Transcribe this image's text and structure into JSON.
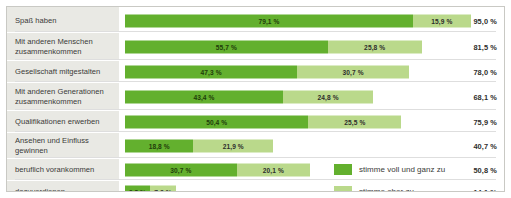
{
  "chart_data": {
    "type": "bar",
    "orientation": "horizontal",
    "stacked": true,
    "title": "",
    "subtitle": "",
    "xlabel": "",
    "ylabel": "",
    "xlim": [
      0,
      100
    ],
    "grid": false,
    "legend_position": "inside-bottom-right",
    "value_suffix": "%",
    "categories": [
      "Spaß haben",
      "Mit anderen Menschen zusammenkommen",
      "Gesellschaft mitgestalten",
      "Mit anderen Generationen zusammenkommen",
      "Qualifikationen erwerben",
      "Ansehen und Einfluss gewinnen",
      "beruflich vorankommen",
      "dazuverdienen"
    ],
    "series": [
      {
        "name": "stimme voll und ganz zu",
        "color": "#63b02e",
        "values": [
          79.1,
          55.7,
          47.3,
          43.4,
          50.4,
          18.8,
          30.7,
          6.8
        ]
      },
      {
        "name": "stimme eher zu",
        "color": "#bad98b",
        "values": [
          15.9,
          25.8,
          30.7,
          24.8,
          25.5,
          21.9,
          20.1,
          7.3
        ]
      }
    ],
    "totals": [
      95.0,
      81.5,
      78.0,
      68.1,
      75.9,
      40.7,
      50.8,
      14.1
    ]
  },
  "rows": [
    {
      "category": [
        "Spaß haben"
      ],
      "a_value": "79,1 %",
      "a_pct": 79.1,
      "b_value": "15,9 %",
      "b_pct": 15.9,
      "total": "95,0 %"
    },
    {
      "category": [
        "Mit anderen Menschen",
        "zusammenkommen"
      ],
      "a_value": "55,7 %",
      "a_pct": 55.7,
      "b_value": "25,8 %",
      "b_pct": 25.8,
      "total": "81,5 %"
    },
    {
      "category": [
        "Gesellschaft mitgestalten"
      ],
      "a_value": "47,3 %",
      "a_pct": 47.3,
      "b_value": "30,7 %",
      "b_pct": 30.7,
      "total": "78,0 %"
    },
    {
      "category": [
        "Mit anderen Generationen",
        "zusammenkommen"
      ],
      "a_value": "43,4 %",
      "a_pct": 43.4,
      "b_value": "24,8 %",
      "b_pct": 24.8,
      "total": "68,1 %"
    },
    {
      "category": [
        "Qualifikationen erwerben"
      ],
      "a_value": "50,4 %",
      "a_pct": 50.4,
      "b_value": "25,5 %",
      "b_pct": 25.5,
      "total": "75,9 %"
    },
    {
      "category": [
        "Ansehen und Einfluss",
        "gewinnen"
      ],
      "a_value": "18,8 %",
      "a_pct": 18.8,
      "b_value": "21,9 %",
      "b_pct": 21.9,
      "total": "40,7 %"
    },
    {
      "category": [
        "beruflich vorankommen"
      ],
      "a_value": "30,7 %",
      "a_pct": 30.7,
      "b_value": "20,1 %",
      "b_pct": 20.1,
      "total": "50,8 %"
    },
    {
      "category": [
        "dazuverdienen"
      ],
      "a_value": "6,8 %",
      "a_pct": 6.8,
      "b_value": "7,3 %",
      "b_pct": 7.3,
      "total": "14,1 %"
    }
  ],
  "legend": {
    "items": [
      {
        "label": "stimme voll und ganz zu",
        "color": "#63b02e"
      },
      {
        "label": "stimme eher zu",
        "color": "#bad98b"
      }
    ]
  },
  "colors": {
    "series_a": "#63b02e",
    "series_b": "#bad98b",
    "label_column_bg": "#e9e9e4",
    "frame_border": "#c9c9c4",
    "page_bg": "#ffffff"
  }
}
